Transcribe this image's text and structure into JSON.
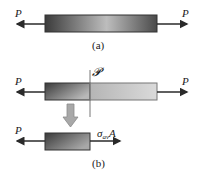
{
  "figure": {
    "panel_a": {
      "caption": "(a)",
      "left_force_label": "P",
      "right_force_label": "P"
    },
    "panel_b": {
      "caption": "(b)",
      "section_plane_label": "𝓟",
      "left_force_label": "P",
      "right_force_label": "P",
      "free_body": {
        "left_force_label": "P",
        "internal_force_label_main": "σ",
        "internal_force_label_sub": "av",
        "internal_force_label_tail": "A"
      }
    },
    "colors": {
      "bar_dark": "#3a3a3a",
      "bar_light": "#c9c9c9",
      "arrow": "#2a2a2a",
      "hollow_arrow": "#a8a8a8"
    }
  }
}
